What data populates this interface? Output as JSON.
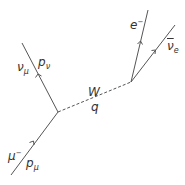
{
  "diagram": {
    "type": "feynman",
    "colors": {
      "line": "#555555",
      "text": "#333333",
      "background": "#ffffff"
    },
    "vertices": [
      {
        "id": "v1",
        "x": 58,
        "y": 112
      },
      {
        "id": "v2",
        "x": 131,
        "y": 82
      }
    ],
    "particles": {
      "muon": {
        "symbol": "μ",
        "charge": "−",
        "momentum": "p",
        "momentum_sub": "μ"
      },
      "muon_neutrino": {
        "symbol": "ν",
        "sub": "μ",
        "momentum": "p",
        "momentum_sub": "ν"
      },
      "w_boson": {
        "symbol": "W",
        "momentum": "q"
      },
      "electron": {
        "symbol": "e",
        "charge": "−"
      },
      "electron_antineutrino": {
        "symbol": "ν",
        "sub": "e"
      }
    }
  }
}
